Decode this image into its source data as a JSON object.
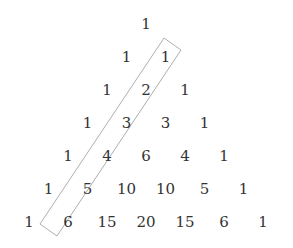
{
  "rows": [
    [
      1
    ],
    [
      1,
      1
    ],
    [
      1,
      2,
      1
    ],
    [
      1,
      3,
      3,
      1
    ],
    [
      1,
      4,
      6,
      4,
      1
    ],
    [
      1,
      5,
      10,
      10,
      5,
      1
    ],
    [
      1,
      6,
      15,
      20,
      15,
      6,
      1
    ]
  ],
  "highlight": {
    "description": "Diagonal enclosing the second entry of rows 1 through 6",
    "values": [
      1,
      2,
      3,
      4,
      5,
      6
    ],
    "stroke_color": "#999999"
  },
  "text_color": "#333333"
}
